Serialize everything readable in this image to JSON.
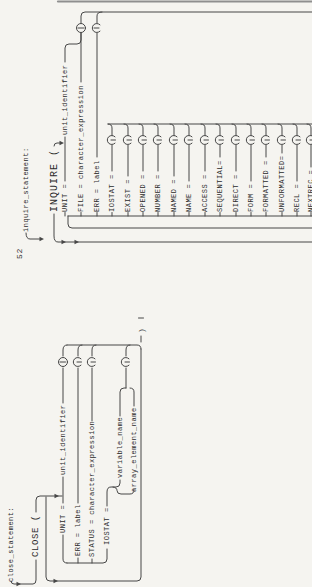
{
  "page_number": "52",
  "inquire": {
    "heading": "inquire_statement:",
    "keyword": "INQUIRE (",
    "unit_identifier": "unit_identifier",
    "keywords": [
      "UNIT =",
      "FILE = character_expression",
      "ERR = label",
      "IOSTAT =",
      "EXIST =",
      "OPENED =",
      "NUMBER =",
      "NAMED =",
      "NAME =",
      "ACCESS =",
      "SEQUENTIAL=",
      "DIRECT =",
      "FORM =",
      "FORMATTED =",
      "UNFORMATTED=",
      "RECL =",
      "NEXTREC ="
    ]
  },
  "close": {
    "heading": "close_statement:",
    "keyword": "CLOSE (",
    "unit": "UNIT =",
    "unit_identifier": "unit_identifier",
    "err": "ERR = label",
    "status": "STATUS = character_expression",
    "iostat": "IOSTAT =",
    "variable": "variable_name",
    "array": "array_element_name",
    "paren": ")"
  },
  "colors": {
    "line": "#474747",
    "paper": "#f5f4f0",
    "scan_edge": "#8f8f8f"
  }
}
